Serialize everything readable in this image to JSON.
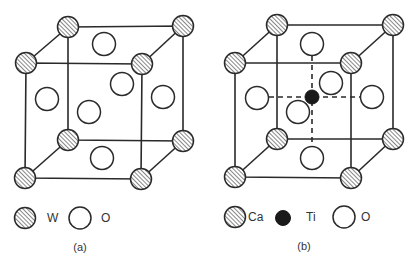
{
  "figure": {
    "panels": [
      {
        "id": "a",
        "caption": "(a)",
        "structure": "WO3-type cubic cell",
        "legend": [
          {
            "symbol": "hatched-circle",
            "label": "W"
          },
          {
            "symbol": "open-circle",
            "label": "O"
          }
        ]
      },
      {
        "id": "b",
        "caption": "(b)",
        "structure": "CaTiO3 perovskite cubic cell",
        "legend": [
          {
            "symbol": "hatched-circle",
            "label": "Ca"
          },
          {
            "symbol": "filled-circle",
            "label": "Ti"
          },
          {
            "symbol": "open-circle",
            "label": "O"
          }
        ]
      }
    ],
    "colors": {
      "line": "#2a2a2a",
      "hatch": "#555555",
      "filled_atom": "#1a1a1a",
      "background": "#ffffff"
    }
  }
}
